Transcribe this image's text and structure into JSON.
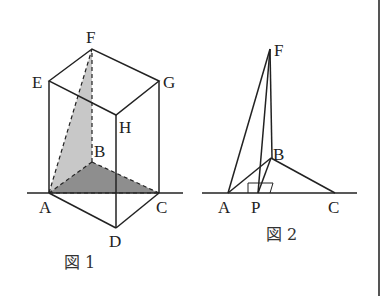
{
  "figure1": {
    "caption": "図 1",
    "labels": {
      "A": "A",
      "B": "B",
      "C": "C",
      "D": "D",
      "E": "E",
      "F": "F",
      "G": "G",
      "H": "H"
    },
    "points": {
      "A": [
        49,
        193
      ],
      "B": [
        92,
        162
      ],
      "C": [
        159,
        193
      ],
      "D": [
        116,
        228
      ],
      "E": [
        49,
        81
      ],
      "F": [
        92,
        49
      ],
      "G": [
        159,
        81
      ],
      "H": [
        116,
        115
      ]
    },
    "colors": {
      "light_shade": "#c8c8c8",
      "dark_shade": "#8e8e8e",
      "stroke": "#222222"
    }
  },
  "figure2": {
    "caption": "図 2",
    "labels": {
      "A": "A",
      "P": "P",
      "B": "B",
      "C": "C",
      "F": "F"
    },
    "points": {
      "A": [
        228,
        193
      ],
      "P": [
        258,
        193
      ],
      "B": [
        271,
        158
      ],
      "C": [
        335,
        193
      ],
      "F": [
        270,
        49
      ]
    }
  }
}
